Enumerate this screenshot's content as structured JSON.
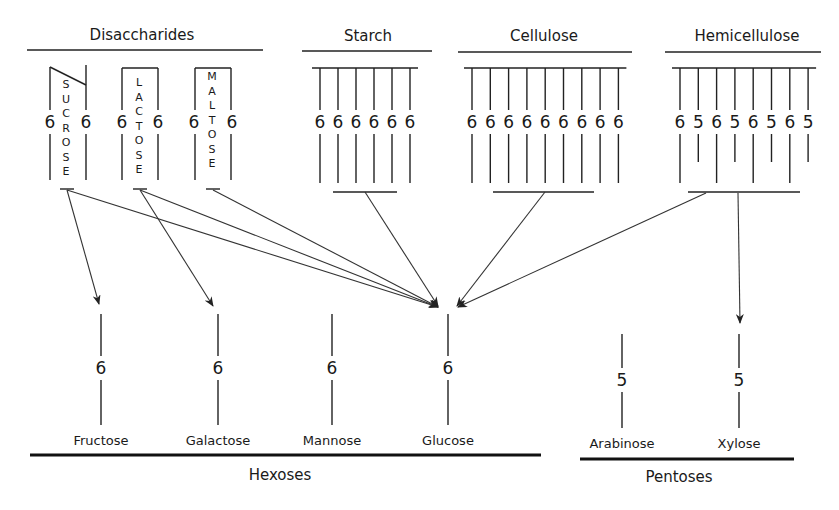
{
  "diagram": {
    "sources": {
      "disaccharides": {
        "title": "Disaccharides",
        "items": [
          {
            "name": "SUCROSE",
            "left_carbon": "6",
            "right_carbon": "6"
          },
          {
            "name": "LACTOSE",
            "left_carbon": "6",
            "right_carbon": "6"
          },
          {
            "name": "MALTOSE",
            "left_carbon": "6",
            "right_carbon": "6"
          }
        ]
      },
      "starch": {
        "title": "Starch",
        "units": [
          "6",
          "6",
          "6",
          "6",
          "6",
          "6"
        ]
      },
      "cellulose": {
        "title": "Cellulose",
        "units": [
          "6",
          "6",
          "6",
          "6",
          "6",
          "6",
          "6",
          "6",
          "6"
        ]
      },
      "hemicellulose": {
        "title": "Hemicellulose",
        "units": [
          "6",
          "5",
          "6",
          "5",
          "6",
          "5",
          "6",
          "5"
        ]
      }
    },
    "monosaccharides": {
      "hexoses": {
        "label": "Hexoses",
        "items": [
          {
            "name": "Fructose",
            "carbons": "6"
          },
          {
            "name": "Galactose",
            "carbons": "6"
          },
          {
            "name": "Mannose",
            "carbons": "6"
          },
          {
            "name": "Glucose",
            "carbons": "6"
          }
        ]
      },
      "pentoses": {
        "label": "Pentoses",
        "items": [
          {
            "name": "Arabinose",
            "carbons": "5"
          },
          {
            "name": "Xylose",
            "carbons": "5"
          }
        ]
      }
    },
    "edges": [
      {
        "from": "Sucrose",
        "to": "Fructose"
      },
      {
        "from": "Sucrose",
        "to": "Glucose"
      },
      {
        "from": "Lactose",
        "to": "Galactose"
      },
      {
        "from": "Lactose",
        "to": "Glucose"
      },
      {
        "from": "Maltose",
        "to": "Glucose"
      },
      {
        "from": "Starch",
        "to": "Glucose"
      },
      {
        "from": "Cellulose",
        "to": "Glucose"
      },
      {
        "from": "Hemicellulose",
        "to": "Glucose"
      },
      {
        "from": "Hemicellulose",
        "to": "Xylose"
      }
    ]
  }
}
